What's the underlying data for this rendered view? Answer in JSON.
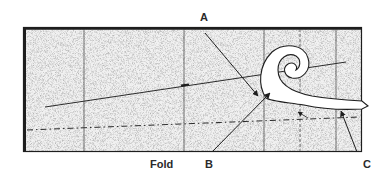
{
  "diagram": {
    "type": "pattern-drafting-illustration",
    "labels": {
      "a": "A",
      "b": "B",
      "c": "C",
      "fold": "Fold"
    },
    "colors": {
      "paper": "#e9e9e9",
      "stipple": "#9a9a9a",
      "outline": "#1e1e1e",
      "line": "#2b2b2b",
      "curve_fill": "#ffffff"
    }
  }
}
